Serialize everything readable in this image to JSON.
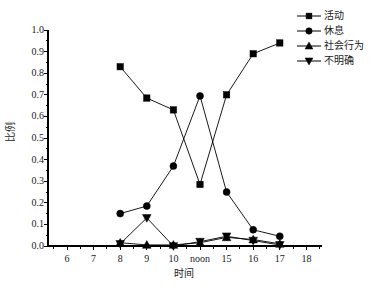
{
  "chart_data": {
    "type": "line",
    "title": "",
    "xlabel": "时间",
    "ylabel": "比例",
    "categories": [
      "6",
      "7",
      "8",
      "9",
      "10",
      "noon",
      "15",
      "16",
      "17",
      "18"
    ],
    "x_tick_labels": [
      "6",
      "7",
      "8",
      "9",
      "10",
      "noon",
      "15",
      "16",
      "17",
      "18"
    ],
    "y_tick_labels": [
      "0.0",
      "0.1",
      "0.2",
      "0.3",
      "0.4",
      "0.5",
      "0.6",
      "0.7",
      "0.8",
      "0.9",
      "1.0"
    ],
    "ylim": [
      0.0,
      1.0
    ],
    "y_tick_step": 0.1,
    "grid": false,
    "legend_position": "top-right",
    "data_x_categories": [
      "8",
      "9",
      "10",
      "noon",
      "15",
      "16",
      "17"
    ],
    "series": [
      {
        "name": "活动",
        "marker": "square",
        "color": "#000000",
        "x": [
          "8",
          "9",
          "10",
          "noon",
          "15",
          "16",
          "17"
        ],
        "values": [
          0.83,
          0.685,
          0.63,
          0.285,
          0.7,
          0.89,
          0.94
        ]
      },
      {
        "name": "休息",
        "marker": "circle",
        "color": "#000000",
        "x": [
          "8",
          "9",
          "10",
          "noon",
          "15",
          "16",
          "17"
        ],
        "values": [
          0.15,
          0.185,
          0.37,
          0.695,
          0.25,
          0.075,
          0.045
        ]
      },
      {
        "name": "社会行为",
        "marker": "triangle-up",
        "color": "#000000",
        "x": [
          "8",
          "9",
          "10",
          "noon",
          "15",
          "16",
          "17"
        ],
        "values": [
          0.015,
          0.005,
          0.005,
          0.015,
          0.04,
          0.03,
          0.01
        ]
      },
      {
        "name": "不明确",
        "marker": "triangle-down",
        "color": "#000000",
        "x": [
          "8",
          "9",
          "10",
          "noon",
          "15",
          "16",
          "17"
        ],
        "values": [
          0.01,
          0.13,
          0.0,
          0.02,
          0.045,
          0.025,
          0.005
        ]
      }
    ]
  },
  "axes": {
    "x_title": "时间",
    "y_title": "比例",
    "x_ticks": [
      "6",
      "7",
      "8",
      "9",
      "10",
      "noon",
      "15",
      "16",
      "17",
      "18"
    ],
    "y_ticks": [
      "0.0",
      "0.1",
      "0.2",
      "0.3",
      "0.4",
      "0.5",
      "0.6",
      "0.7",
      "0.8",
      "0.9",
      "1.0"
    ]
  },
  "legend": {
    "items": [
      {
        "label": "活动",
        "marker": "square"
      },
      {
        "label": "休息",
        "marker": "circle"
      },
      {
        "label": "社会行为",
        "marker": "triangle-up"
      },
      {
        "label": "不明确",
        "marker": "triangle-down"
      }
    ]
  },
  "colors": {
    "ink": "#000000",
    "background": "#ffffff"
  }
}
